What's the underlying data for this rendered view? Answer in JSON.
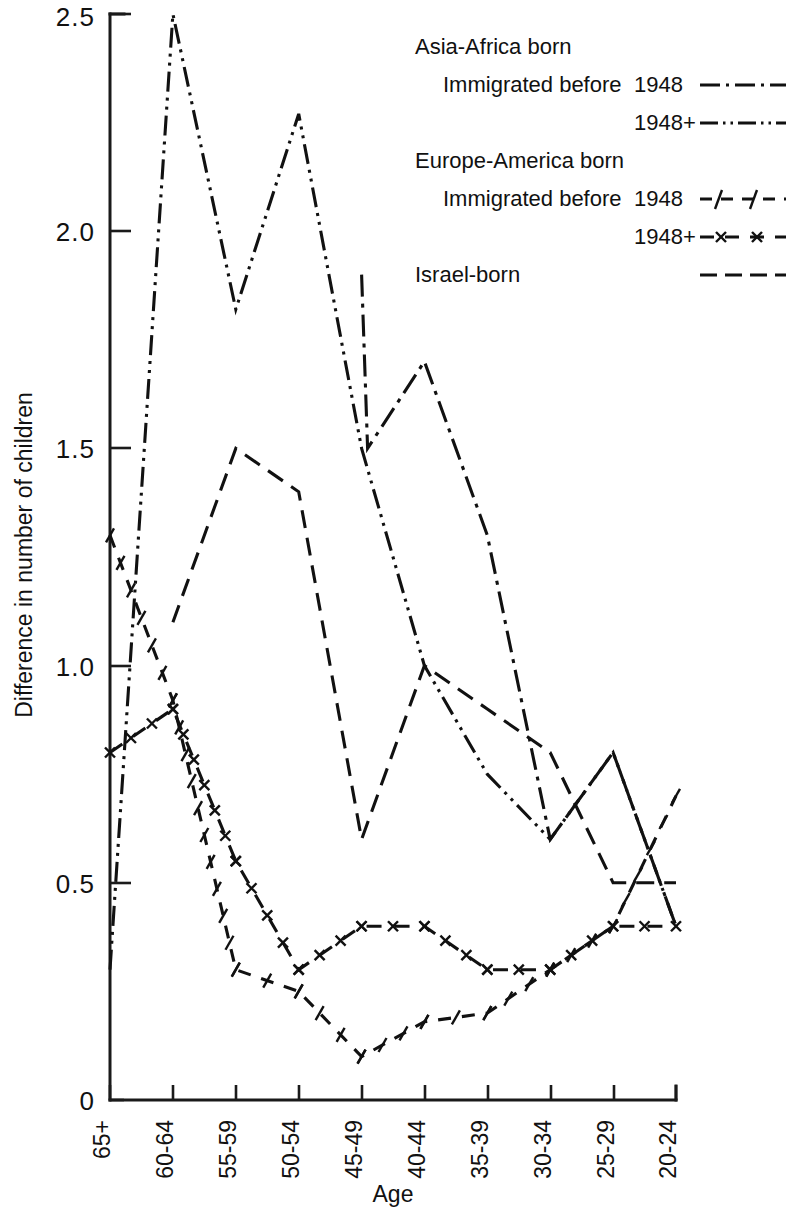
{
  "figure": {
    "y_axis": {
      "label": "Difference in number of children",
      "ticks": [
        "0",
        "0.5",
        "1.0",
        "1.5",
        "2.0",
        "2.5"
      ],
      "min": 0,
      "max": 2.5
    },
    "x_axis": {
      "label": "Age",
      "ticks": [
        "65+",
        "60-64",
        "55-59",
        "50-54",
        "45-49",
        "40-44",
        "35-39",
        "30-34",
        "25-29",
        "20-24"
      ]
    },
    "legend": {
      "group_a": "Asia-Africa born",
      "a_line1_prefix": "Immigrated before",
      "a_line1_year": "1948",
      "a_line2_year": "1948+",
      "group_b": "Europe-America born",
      "b_line1_prefix": "Immigrated before",
      "b_line1_year": "1948",
      "b_line2_year": "1948+",
      "group_c": "Israel-born"
    }
  },
  "chart_data": {
    "type": "line",
    "title": "",
    "xlabel": "Age",
    "ylabel": "Difference in number of children",
    "categories": [
      "65+",
      "60-64",
      "55-59",
      "50-54",
      "45-49",
      "40-44",
      "35-39",
      "30-34",
      "25-29",
      "20-24"
    ],
    "ylim": [
      0,
      2.5
    ],
    "yticks": [
      0,
      0.5,
      1.0,
      1.5,
      2.0,
      2.5
    ],
    "grid": false,
    "legend_position": "top-right",
    "series": [
      {
        "name": "Asia-Africa born, Immigrated before 1948",
        "legend_label": "Asia-Africa born / Immigrated before 1948",
        "style": "dash-dot",
        "values": [
          null,
          null,
          null,
          null,
          1.9,
          1.7,
          1.3,
          0.6,
          0.8,
          0.4
        ],
        "note": "segment from 45-49 dips to 1.5 between 45-49 and 40-44 before rising to the 1.7 peak at 40-44"
      },
      {
        "name": "Asia-Africa born, 1948+",
        "legend_label": "Asia-Africa born / 1948+",
        "style": "dash-dot-dot",
        "values": [
          0.3,
          2.5,
          1.82,
          2.27,
          1.5,
          1.0,
          0.75,
          0.6,
          0.8,
          0.4
        ]
      },
      {
        "name": "Europe-America born, Immigrated before 1948",
        "legend_label": "Europe-America born / Immigrated before 1948",
        "style": "dash-slash",
        "values": [
          1.3,
          0.92,
          0.3,
          0.25,
          0.1,
          0.18,
          0.2,
          0.3,
          0.4,
          0.7
        ]
      },
      {
        "name": "Europe-America born, 1948+",
        "legend_label": "Europe-America born / 1948+",
        "style": "dash-x",
        "values": [
          0.8,
          0.9,
          0.55,
          0.3,
          0.4,
          0.4,
          0.3,
          0.3,
          0.4,
          0.4
        ]
      },
      {
        "name": "Israel-born",
        "legend_label": "Israel-born",
        "style": "long-dash",
        "values": [
          null,
          1.1,
          1.5,
          1.4,
          0.6,
          1.0,
          0.9,
          0.8,
          0.5,
          0.5
        ]
      }
    ]
  }
}
